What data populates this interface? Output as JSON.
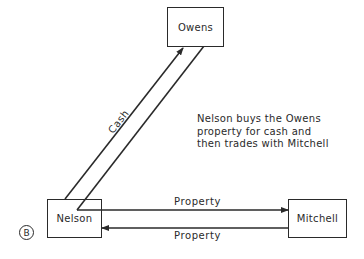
{
  "diagram": {
    "nodes": {
      "owens": "Owens",
      "nelson": "Nelson",
      "mitchell": "Mitchell"
    },
    "edges": {
      "cash": "Cash",
      "property_to_mitchell": "Property",
      "property_to_nelson": "Property"
    },
    "note": {
      "line1": "Nelson buys the Owens",
      "line2": "property for cash and",
      "line3": "then trades with Mitchell"
    },
    "panel_label": "B"
  }
}
